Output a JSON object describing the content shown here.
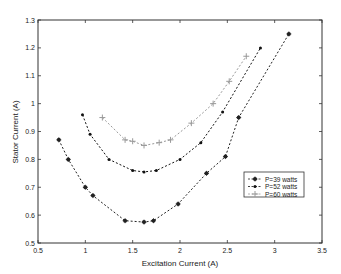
{
  "chart_data": {
    "type": "line",
    "title": "",
    "xlabel": "Excitation Current (A)",
    "ylabel": "Stator Current (A)",
    "xlim": [
      0.5,
      3.5
    ],
    "ylim": [
      0.5,
      1.3
    ],
    "xticks": [
      "0.5",
      "1",
      "1.5",
      "2",
      "2.5",
      "3",
      "3.5"
    ],
    "yticks": [
      "0.5",
      "0.6",
      "0.7",
      "0.8",
      "0.9",
      "1",
      "1.1",
      "1.2",
      "1.3"
    ],
    "grid": false,
    "legend_position": "lower right",
    "series": [
      {
        "name": "P=39 watts",
        "color": "#222222",
        "marker": "*",
        "x": [
          0.72,
          0.82,
          1.0,
          1.08,
          1.42,
          1.62,
          1.72,
          1.98,
          2.28,
          2.48,
          2.62,
          3.15
        ],
        "y": [
          0.87,
          0.8,
          0.7,
          0.67,
          0.58,
          0.575,
          0.58,
          0.64,
          0.75,
          0.81,
          0.95,
          1.25
        ]
      },
      {
        "name": "P=52 watts",
        "color": "#111111",
        "marker": ".",
        "x": [
          0.97,
          1.05,
          1.25,
          1.5,
          1.62,
          1.75,
          2.0,
          2.22,
          2.45,
          2.85
        ],
        "y": [
          0.96,
          0.89,
          0.8,
          0.76,
          0.755,
          0.76,
          0.8,
          0.86,
          0.97,
          1.2
        ]
      },
      {
        "name": "P=60 watts",
        "color": "#999999",
        "marker": "+",
        "x": [
          1.18,
          1.42,
          1.5,
          1.62,
          1.78,
          1.9,
          2.12,
          2.35,
          2.52,
          2.7
        ],
        "y": [
          0.95,
          0.87,
          0.865,
          0.85,
          0.86,
          0.87,
          0.93,
          1.0,
          1.08,
          1.17
        ]
      }
    ]
  }
}
